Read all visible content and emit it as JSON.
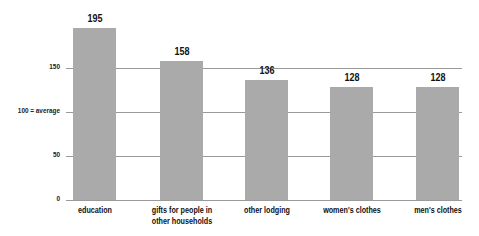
{
  "chart_data": {
    "type": "bar",
    "title": "",
    "xlabel": "",
    "ylabel": "",
    "categories": [
      "education",
      "gifts for people in other households",
      "other lodging",
      "women's clothes",
      "men's clothes"
    ],
    "category_lines": [
      [
        "education"
      ],
      [
        "gifts for people in",
        "other households"
      ],
      [
        "other lodging"
      ],
      [
        "women's clothes"
      ],
      [
        "men's clothes"
      ]
    ],
    "values": [
      195,
      158,
      136,
      128,
      128
    ],
    "value_labels": [
      "195",
      "158",
      "136",
      "128",
      "128"
    ],
    "ylim": [
      0,
      200
    ],
    "yticks": [
      0,
      50,
      100,
      150
    ],
    "ytick_labels": [
      "0",
      "50",
      "100 = average",
      "150"
    ],
    "grid": true,
    "reference_line": {
      "value": 100,
      "label": "100 = average"
    },
    "bar_color": "#aaaaaa",
    "grid_color": "#9a9a9a"
  }
}
